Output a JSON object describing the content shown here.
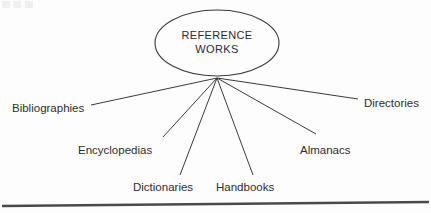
{
  "diagram": {
    "type": "hub-and-spoke",
    "center_node": {
      "label_line1": "REFERENCE",
      "label_line2": "WORKS",
      "shape": "ellipse",
      "cx": 217,
      "cy": 43,
      "rx": 62,
      "ry": 33
    },
    "hub_point": {
      "x": 217,
      "y": 78
    },
    "stroke_color": "#3a3a3a",
    "text_color": "#2d2d2d",
    "background_color": "#fdfdfd",
    "leaves": [
      {
        "label": "Bibliographies",
        "text_x": 12,
        "text_y": 112,
        "anchor": "start",
        "line_end_x": 91,
        "line_end_y": 105
      },
      {
        "label": "Encyclopedias",
        "text_x": 78,
        "text_y": 154,
        "anchor": "start",
        "line_end_x": 163,
        "line_end_y": 137
      },
      {
        "label": "Dictionaries",
        "text_x": 133,
        "text_y": 191,
        "anchor": "start",
        "line_end_x": 180,
        "line_end_y": 175
      },
      {
        "label": "Handbooks",
        "text_x": 216,
        "text_y": 191,
        "anchor": "start",
        "line_end_x": 253,
        "line_end_y": 175
      },
      {
        "label": "Almanacs",
        "text_x": 300,
        "text_y": 154,
        "anchor": "start",
        "line_end_x": 316,
        "line_end_y": 134
      },
      {
        "label": "Directories",
        "text_x": 364,
        "text_y": 107,
        "anchor": "start",
        "line_end_x": 358,
        "line_end_y": 99
      }
    ],
    "baseline": {
      "x1": 2,
      "y1": 206,
      "x2": 429,
      "y2": 202
    }
  }
}
